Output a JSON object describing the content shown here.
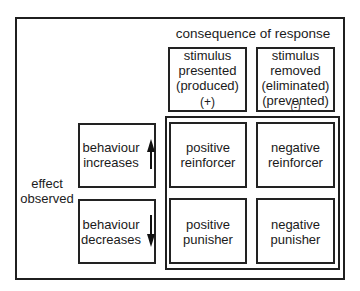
{
  "header": {
    "title": "consequence of response"
  },
  "columns": [
    {
      "lines": [
        "stimulus",
        "presented",
        "(produced)"
      ],
      "sign": "(+)"
    },
    {
      "lines": [
        "stimulus",
        "removed",
        "(eliminated)",
        "(prevented)"
      ],
      "sign": "(-)"
    }
  ],
  "side_label": {
    "lines": [
      "effect",
      "observed"
    ]
  },
  "rows": [
    {
      "lines": [
        "behaviour",
        "increases"
      ],
      "arrow": "arrow-up"
    },
    {
      "lines": [
        "behaviour",
        "decreases"
      ],
      "arrow": "arrow-down"
    }
  ],
  "cells": [
    [
      {
        "lines": [
          "positive",
          "reinforcer"
        ]
      },
      {
        "lines": [
          "negative",
          "reinforcer"
        ]
      }
    ],
    [
      {
        "lines": [
          "positive",
          "punisher"
        ]
      },
      {
        "lines": [
          "negative",
          "punisher"
        ]
      }
    ]
  ],
  "colors": {
    "line": "#1f1f1f",
    "background": "#ffffff",
    "text": "#1c1c1c"
  }
}
